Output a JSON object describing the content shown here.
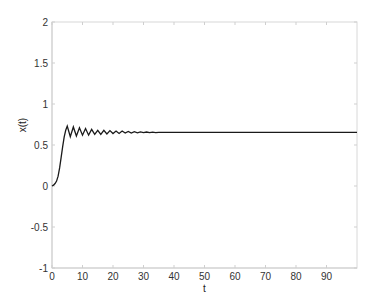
{
  "chart_data": {
    "type": "line",
    "title": "",
    "xlabel": "t",
    "ylabel": "x(t)",
    "xlim": [
      0,
      100
    ],
    "ylim": [
      -1,
      2
    ],
    "xticks": [
      0,
      10,
      20,
      30,
      40,
      50,
      60,
      70,
      80,
      90
    ],
    "xtick_labels": [
      "0",
      "10",
      "20",
      "30",
      "40",
      "50",
      "60",
      "70",
      "80",
      "90"
    ],
    "yticks": [
      -1,
      -0.5,
      0,
      0.5,
      1,
      1.5,
      2
    ],
    "ytick_labels": [
      "-1",
      "-0.5",
      "0",
      "0.5",
      "1",
      "1.5",
      "2"
    ],
    "grid": false,
    "legend": null,
    "series": [
      {
        "name": "x(t)",
        "color": "#1a1a1a",
        "x": [
          0,
          0.5,
          1,
          1.5,
          2,
          2.5,
          3,
          3.5,
          4,
          4.5,
          5,
          6,
          7,
          8,
          9,
          10,
          11,
          12,
          13,
          14,
          15,
          16,
          17,
          18,
          19,
          20,
          21,
          22,
          23,
          24,
          25,
          26,
          27,
          28,
          29,
          30,
          31,
          32,
          33,
          34,
          35,
          36,
          37,
          38,
          40,
          50,
          60,
          70,
          80,
          90,
          100
        ],
        "values": [
          0,
          0.01,
          0.03,
          0.06,
          0.12,
          0.22,
          0.35,
          0.48,
          0.6,
          0.68,
          0.73,
          0.6,
          0.72,
          0.61,
          0.71,
          0.62,
          0.7,
          0.62,
          0.69,
          0.63,
          0.68,
          0.63,
          0.68,
          0.635,
          0.675,
          0.64,
          0.67,
          0.64,
          0.67,
          0.645,
          0.665,
          0.645,
          0.663,
          0.648,
          0.66,
          0.65,
          0.658,
          0.65,
          0.656,
          0.652,
          0.655,
          0.653,
          0.654,
          0.654,
          0.654,
          0.654,
          0.654,
          0.654,
          0.654,
          0.654,
          0.654
        ]
      }
    ]
  }
}
